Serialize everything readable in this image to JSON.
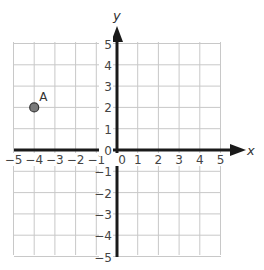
{
  "diagram": {
    "type": "coordinate-plane",
    "x_axis": {
      "label": "x",
      "min": -5,
      "max": 5,
      "ticks": [
        "−5",
        "−4",
        "−3",
        "−2",
        "−1",
        "0",
        "1",
        "2",
        "3",
        "4",
        "5"
      ]
    },
    "y_axis": {
      "label": "y",
      "min": -5,
      "max": 5,
      "ticks": [
        "5",
        "4",
        "3",
        "2",
        "1",
        "0",
        "−1",
        "−2",
        "−3",
        "−4",
        "−5"
      ]
    },
    "grid": {
      "step": 1,
      "color": "#c8c8c8"
    },
    "axis_color": "#1a1a1a",
    "points": [
      {
        "label": "A",
        "x": -4,
        "y": 2,
        "fill": "#7a7a7a",
        "stroke": "#333333"
      }
    ]
  }
}
